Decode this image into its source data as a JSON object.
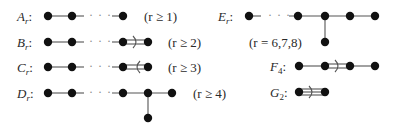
{
  "diagrams": [
    {
      "name": "A",
      "sub": "r",
      "condition": "(r ≥ 1)",
      "bond": "single"
    },
    {
      "name": "B",
      "sub": "r",
      "condition": "(r ≥ 2)",
      "bond": "double-right"
    },
    {
      "name": "C",
      "sub": "r",
      "condition": "(r ≥ 3)",
      "bond": "double-left"
    },
    {
      "name": "D",
      "sub": "r",
      "condition": "(r ≥ 4)",
      "bond": "fork"
    },
    {
      "name": "E",
      "sub": "r",
      "condition": "(r = 6,7,8)",
      "bond": "branch"
    },
    {
      "name": "F",
      "sub": "4",
      "condition": "",
      "bond": "double-right-middle"
    },
    {
      "name": "G",
      "sub": "2",
      "condition": "",
      "bond": "triple-right"
    }
  ],
  "ellipsis": "· · ·",
  "colon": ":",
  "arrow_right": ")",
  "arrow_left": "("
}
